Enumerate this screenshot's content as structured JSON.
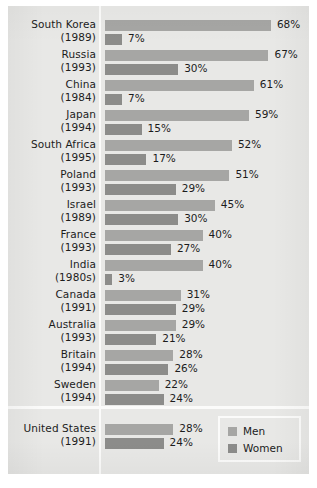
{
  "chart_data": {
    "type": "bar",
    "title": "",
    "subtitle": "",
    "xlabel": "",
    "ylabel": "",
    "orientation": "horizontal",
    "grid": false,
    "legend_position": "bottom-right",
    "xlim": [
      0,
      70
    ],
    "value_suffix": "%",
    "categories": [
      "South Korea",
      "Russia",
      "China",
      "Japan",
      "South Africa",
      "Poland",
      "Israel",
      "France",
      "India",
      "Canada",
      "Australia",
      "Britain",
      "Sweden",
      "United States"
    ],
    "category_years": [
      "(1989)",
      "(1993)",
      "(1984)",
      "(1994)",
      "(1995)",
      "(1993)",
      "(1989)",
      "(1993)",
      "(1980s)",
      "(1991)",
      "(1993)",
      "(1994)",
      "(1994)",
      "(1991)"
    ],
    "series": [
      {
        "name": "Men",
        "color": "#a6a6a4",
        "values": [
          68,
          67,
          61,
          59,
          52,
          51,
          45,
          40,
          40,
          31,
          29,
          28,
          22,
          28
        ],
        "labels": [
          "68%",
          "67%",
          "61%",
          "59%",
          "52%",
          "51%",
          "45%",
          "40%",
          "40%",
          "31%",
          "29%",
          "28%",
          "22%",
          "28%"
        ]
      },
      {
        "name": "Women",
        "color": "#8c8c8a",
        "values": [
          7,
          30,
          7,
          15,
          17,
          29,
          30,
          27,
          3,
          29,
          21,
          26,
          24,
          24
        ],
        "labels": [
          "7%",
          "30%",
          "7%",
          "15%",
          "17%",
          "29%",
          "30%",
          "27%",
          "3%",
          "29%",
          "21%",
          "26%",
          "24%",
          "24%"
        ]
      }
    ]
  },
  "legend": {
    "men_label": "Men",
    "women_label": "Women"
  },
  "style": {
    "panel_background": "#e8e8e6",
    "men_color": "#a6a6a4",
    "women_color": "#8c8c8a",
    "divider_color": "#fbfbfa",
    "text_color": "#1c1c1c"
  }
}
